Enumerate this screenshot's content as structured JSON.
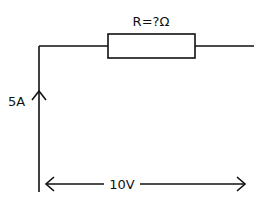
{
  "diagram": {
    "type": "circuit",
    "resistor": {
      "label": "R=?Ω"
    },
    "current": {
      "label": "5A",
      "direction": "up"
    },
    "voltage": {
      "label": "10V",
      "direction": "both"
    },
    "colors": {
      "line": "#111111",
      "background": "#ffffff"
    }
  }
}
